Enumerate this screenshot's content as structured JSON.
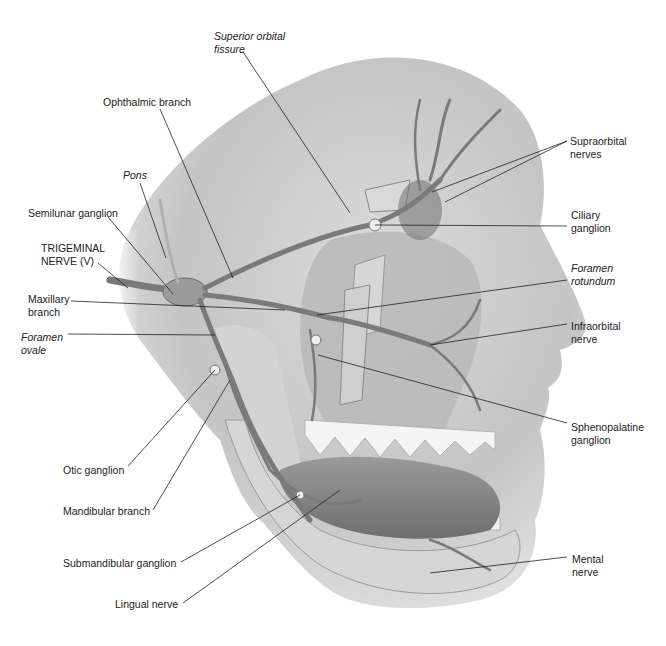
{
  "figure": {
    "labels": [
      {
        "id": "superior-orbital-fissure",
        "text": "Superior orbital\nfissure",
        "italic": true,
        "x": 214,
        "y": 30
      },
      {
        "id": "ophthalmic-branch",
        "text": "Ophthalmic branch",
        "italic": false,
        "x": 103,
        "y": 96
      },
      {
        "id": "pons",
        "text": "Pons",
        "italic": true,
        "x": 123,
        "y": 169
      },
      {
        "id": "semilunar-ganglion",
        "text": "Semilunar ganglion",
        "italic": false,
        "x": 28,
        "y": 207
      },
      {
        "id": "trigeminal-nerve",
        "text": "TRIGEMINAL\nNERVE (V)",
        "italic": false,
        "x": 41,
        "y": 242
      },
      {
        "id": "maxillary-branch",
        "text": "Maxillary\nbranch",
        "italic": false,
        "x": 28,
        "y": 293
      },
      {
        "id": "foramen-ovale",
        "text": "Foramen\novale",
        "italic": true,
        "x": 21,
        "y": 331
      },
      {
        "id": "otic-ganglion",
        "text": "Otic ganglion",
        "italic": false,
        "x": 63,
        "y": 464
      },
      {
        "id": "mandibular-branch",
        "text": "Mandibular branch",
        "italic": false,
        "x": 63,
        "y": 505
      },
      {
        "id": "submandibular-ganglion",
        "text": "Submandibular ganglion",
        "italic": false,
        "x": 63,
        "y": 557
      },
      {
        "id": "lingual-nerve",
        "text": "Lingual nerve",
        "italic": false,
        "x": 115,
        "y": 598
      },
      {
        "id": "supraorbital-nerves",
        "text": "Supraorbital\nnerves",
        "italic": false,
        "x": 570,
        "y": 135
      },
      {
        "id": "ciliary-ganglion",
        "text": "Ciliary\nganglion",
        "italic": false,
        "x": 571,
        "y": 209
      },
      {
        "id": "foramen-rotundum",
        "text": "Foramen\nrotundum",
        "italic": true,
        "x": 571,
        "y": 262
      },
      {
        "id": "infraorbital-nerve",
        "text": "Infraorbital\nnerve",
        "italic": false,
        "x": 571,
        "y": 320
      },
      {
        "id": "sphenopalatine-ganglion",
        "text": "Sphenopalatine\nganglion",
        "italic": false,
        "x": 571,
        "y": 421
      },
      {
        "id": "mental-nerve",
        "text": "Mental\nnerve",
        "italic": false,
        "x": 572,
        "y": 553
      }
    ],
    "colors": {
      "skin": "#c8c8c8",
      "skin_shadow": "#8e8e8e",
      "bone": "#d9d9d9",
      "nerve": "#7a7a7a",
      "teeth": "#f4f4f4",
      "leader": "#222222"
    }
  }
}
